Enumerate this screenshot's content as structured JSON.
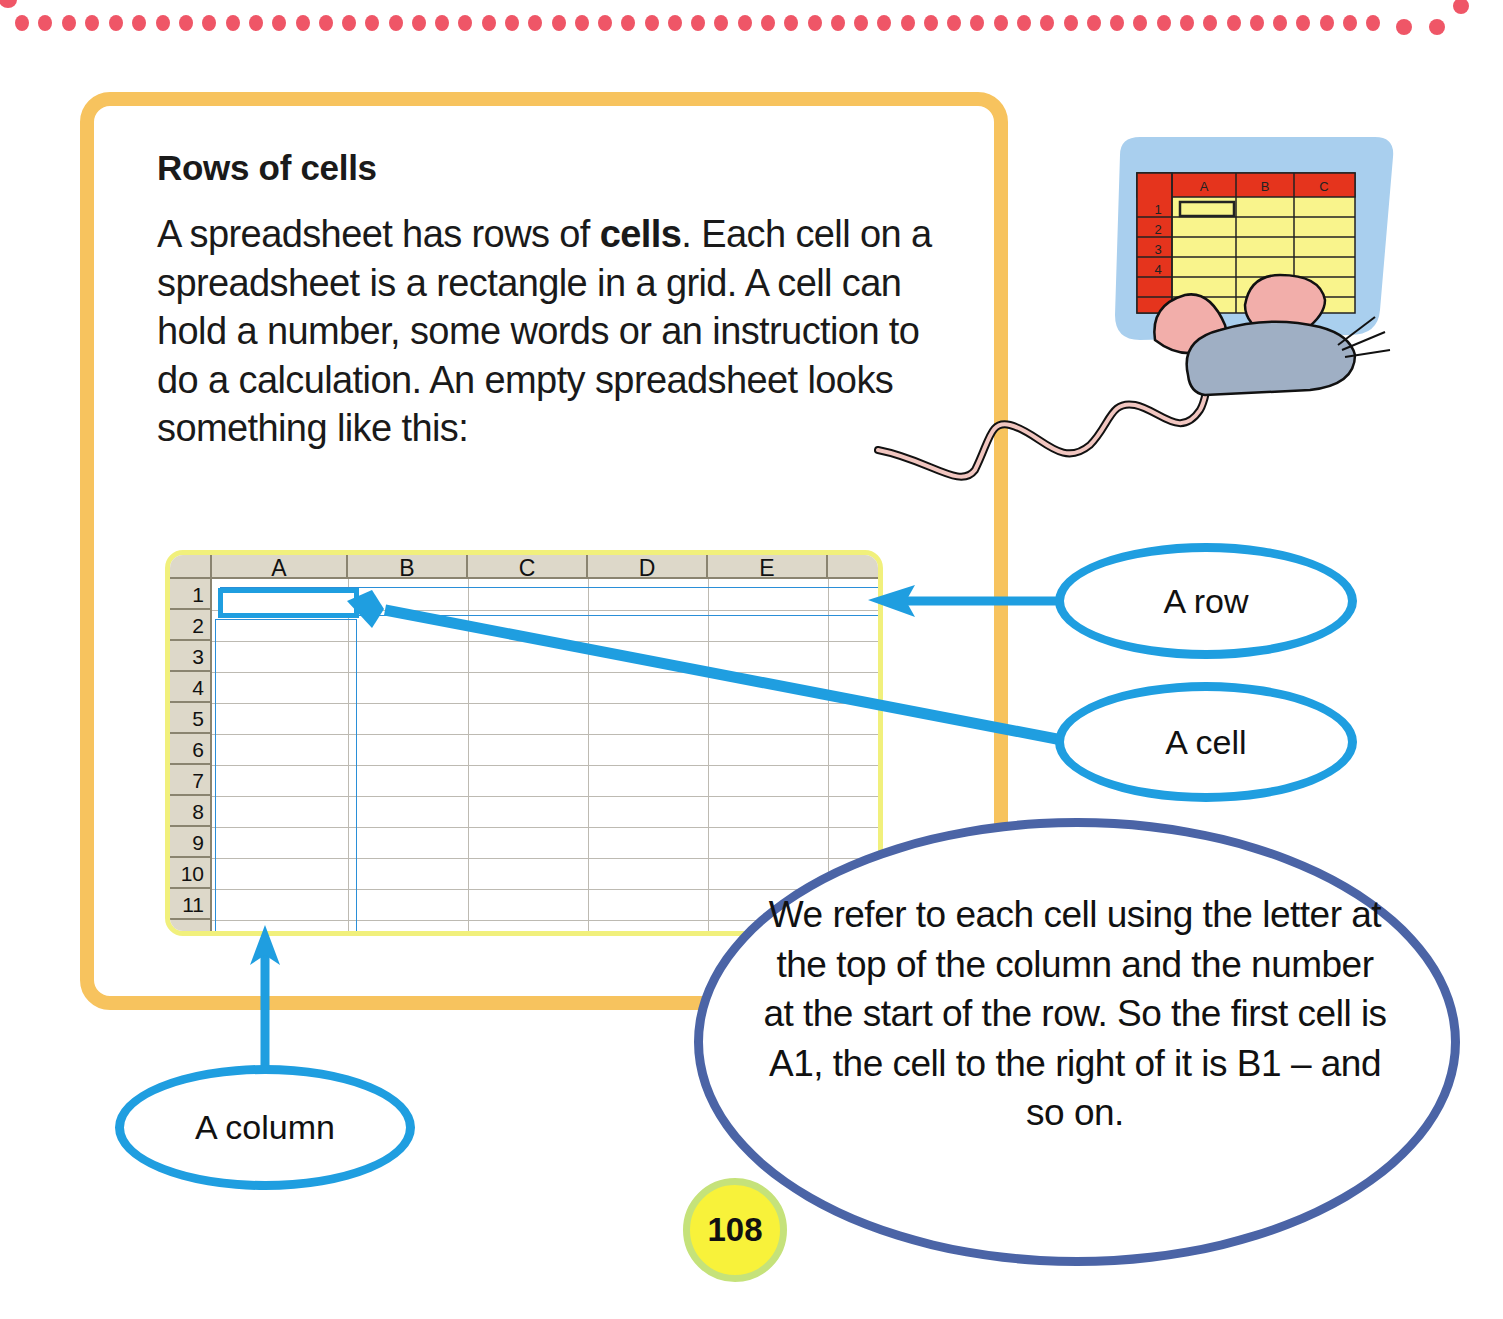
{
  "page": {
    "heading": "Rows of cells",
    "body": {
      "part1": "A spreadsheet has rows of ",
      "bold": "cells",
      "part2": ". Each cell on a spreadsheet is a rectangle in a grid. A cell can hold a number, some words or an instruction to do a calculation. An empty spreadsheet looks something like this:"
    },
    "page_number": "108"
  },
  "spreadsheet": {
    "columns": [
      "A",
      "B",
      "C",
      "D",
      "E"
    ],
    "rows": [
      "1",
      "2",
      "3",
      "4",
      "5",
      "6",
      "7",
      "8",
      "9",
      "10",
      "11"
    ],
    "selected_cell": "A1",
    "highlighted_row": "1",
    "highlighted_column": "A"
  },
  "callouts": {
    "row": "A row",
    "cell": "A cell",
    "column": "A column",
    "explanation": "We refer to each cell using the letter at the top of the column and the number at the start of the row. So the first cell is A1, the cell to the right of it is B1 – and so on."
  },
  "illustration": {
    "subject": "mouse-at-spreadsheet",
    "mini_columns": [
      "A",
      "B",
      "C"
    ],
    "mini_rows": [
      "1",
      "2",
      "3",
      "4",
      "5"
    ]
  },
  "colors": {
    "frame": "#f7c35e",
    "callout_blue": "#1f9ee0",
    "big_oval": "#4b64a6",
    "page_badge": "#f8f23a",
    "dots": "#ef5667"
  }
}
